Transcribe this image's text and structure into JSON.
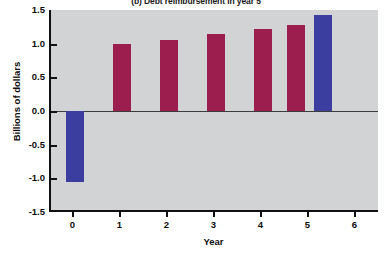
{
  "chart_data": {
    "type": "bar",
    "title": "(b) Debt reimbursement in year 5",
    "xlabel": "Year",
    "ylabel": "Billions of dollars",
    "categories": [
      "0",
      "1",
      "2",
      "3",
      "4",
      "5",
      "6"
    ],
    "x": [
      0,
      1,
      2,
      3,
      4,
      5
    ],
    "values": [
      -1.05,
      1.0,
      1.06,
      1.15,
      1.22,
      1.28,
      1.43
    ],
    "bars": [
      {
        "category": "0",
        "value": -1.05,
        "color": "#3b3e9e",
        "series": "blue"
      },
      {
        "category": "1",
        "value": 1.0,
        "color": "#9b1e4f",
        "series": "maroon"
      },
      {
        "category": "2",
        "value": 1.06,
        "color": "#9b1e4f",
        "series": "maroon"
      },
      {
        "category": "3",
        "value": 1.15,
        "color": "#9b1e4f",
        "series": "maroon"
      },
      {
        "category": "4",
        "value": 1.22,
        "color": "#9b1e4f",
        "series": "maroon"
      },
      {
        "category": "5",
        "value": 1.28,
        "color": "#9b1e4f",
        "series": "maroon"
      },
      {
        "category": "5b",
        "value": 1.43,
        "color": "#3b3e9e",
        "series": "blue"
      }
    ],
    "ylim": [
      -1.5,
      1.5
    ],
    "yticks": [
      1.5,
      1.0,
      0.5,
      0.0,
      -0.5,
      -1.0,
      -1.5
    ],
    "ytick_labels": [
      "1.5",
      "1.0",
      "0.5",
      "0.0",
      "-0.5",
      "-1.0",
      "-1.5"
    ],
    "xlim": [
      -0.5,
      6.5
    ],
    "xticks": [
      0,
      1,
      2,
      3,
      4,
      5,
      6
    ],
    "xtick_labels": [
      "0",
      "1",
      "2",
      "3",
      "4",
      "5",
      "6"
    ],
    "grid": false,
    "legend": null,
    "plot_background": "#d1d3d5",
    "colors": {
      "maroon": "#9b1e4f",
      "blue": "#3b3e9e",
      "axis": "#111111",
      "plot_bg": "#d1d3d5",
      "figure_bg": "#ffffff"
    }
  }
}
